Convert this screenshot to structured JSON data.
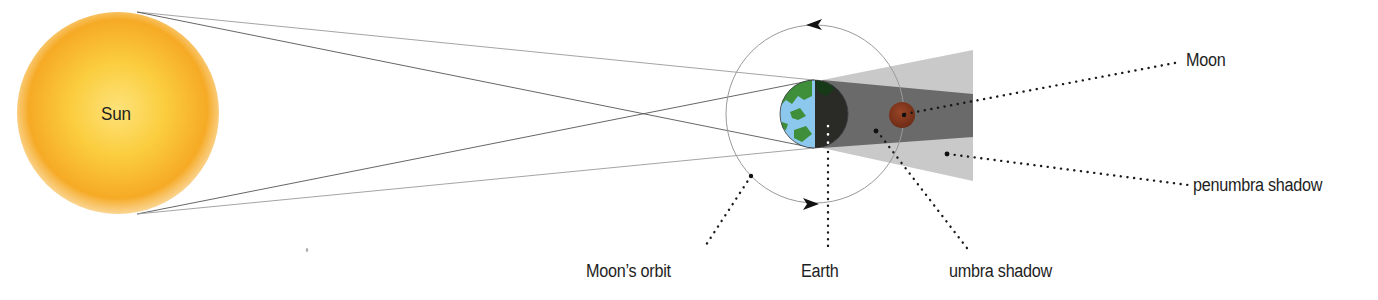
{
  "diagram": {
    "type": "lunar-eclipse",
    "labels": {
      "sun": "Sun",
      "moon": "Moon",
      "penumbra": "penumbra shadow",
      "orbit": "Moon’s orbit",
      "earth": "Earth",
      "umbra": "umbra shadow"
    },
    "bodies": {
      "sun": {
        "cx": 118,
        "cy": 113,
        "r": 100,
        "color_center": "#fde27a",
        "color_edge": "#f5a21f"
      },
      "earth": {
        "cx": 814,
        "cy": 114,
        "r": 34,
        "land": "#3f8f3a",
        "ocean": "#8cc8ee",
        "night": "#2a2a26"
      },
      "moon": {
        "cx": 902,
        "cy": 115,
        "r": 13,
        "color": "#8a3a1e"
      },
      "orbit": {
        "cx": 815,
        "cy": 114,
        "r": 89,
        "color": "#9a9a9a"
      }
    },
    "shadows": {
      "penumbra_color": "#c9c9c9",
      "umbra_color": "#6a6a6a"
    },
    "icons": {
      "orbit_arrow_top": "arrow-left-icon",
      "orbit_arrow_bottom": "arrow-right-icon"
    }
  }
}
